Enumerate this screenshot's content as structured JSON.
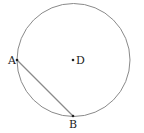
{
  "diagram": {
    "type": "circle-with-chord",
    "circle": {
      "center_label": "D",
      "cx": 73.5,
      "cy": 60,
      "r": 56.5,
      "stroke": "#8a8a8a"
    },
    "points": [
      {
        "label": "A",
        "x": 17,
        "y": 60
      },
      {
        "label": "B",
        "x": 73,
        "y": 116
      },
      {
        "label": "D",
        "x": 73,
        "y": 60
      }
    ],
    "segments": [
      {
        "from": "A",
        "to": "B",
        "stroke": "#8a8a8a"
      }
    ]
  }
}
